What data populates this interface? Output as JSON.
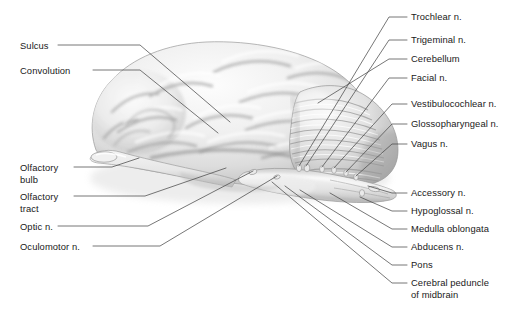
{
  "figure": {
    "background_color": "#ffffff",
    "text_color": "#1a1a1a",
    "leader_line_color": "#4a4a4a"
  },
  "labels_left": [
    {
      "name": "sulcus",
      "text": "Sulcus",
      "text2": "",
      "x": 20,
      "y": 40
    },
    {
      "name": "convolution",
      "text": "Convolution",
      "text2": "",
      "x": 20,
      "y": 65
    },
    {
      "name": "olfactory-bulb",
      "text": "Olfactory",
      "text2": "bulb",
      "x": 20,
      "y": 162
    },
    {
      "name": "olfactory-tract",
      "text": "Olfactory",
      "text2": "tract",
      "x": 20,
      "y": 191
    },
    {
      "name": "optic-n",
      "text": "Optic n.",
      "text2": "",
      "x": 20,
      "y": 221
    },
    {
      "name": "oculomotor-n",
      "text": "Oculomotor n.",
      "text2": "",
      "x": 20,
      "y": 241
    }
  ],
  "labels_right": [
    {
      "name": "trochlear-n",
      "text": "Trochlear n.",
      "text2": "",
      "x": 411,
      "y": 11
    },
    {
      "name": "trigeminal-n",
      "text": "Trigeminal n.",
      "text2": "",
      "x": 411,
      "y": 34
    },
    {
      "name": "cerebellum",
      "text": "Cerebellum",
      "text2": "",
      "x": 411,
      "y": 53
    },
    {
      "name": "facial-n",
      "text": "Facial n.",
      "text2": "",
      "x": 411,
      "y": 72
    },
    {
      "name": "vestibulocochlear-n",
      "text": "Vestibulocochlear n.",
      "text2": "",
      "x": 411,
      "y": 98
    },
    {
      "name": "glossopharyngeal-n",
      "text": "Glossopharyngeal n.",
      "text2": "",
      "x": 411,
      "y": 118
    },
    {
      "name": "vagus-n",
      "text": "Vagus n.",
      "text2": "",
      "x": 411,
      "y": 138
    },
    {
      "name": "accessory-n",
      "text": "Accessory n.",
      "text2": "",
      "x": 411,
      "y": 187
    },
    {
      "name": "hypoglossal-n",
      "text": "Hypoglossal n.",
      "text2": "",
      "x": 411,
      "y": 205
    },
    {
      "name": "medulla-oblongata",
      "text": "Medulla oblongata",
      "text2": "",
      "x": 411,
      "y": 223
    },
    {
      "name": "abducens-n",
      "text": "Abducens n.",
      "text2": "",
      "x": 411,
      "y": 241
    },
    {
      "name": "pons",
      "text": "Pons",
      "text2": "",
      "x": 411,
      "y": 259
    },
    {
      "name": "cerebral-peduncle",
      "text": "Cerebral peduncle",
      "text2": "of midbrain",
      "x": 411,
      "y": 277
    }
  ],
  "leader_lines": {
    "sulcus": "M 58 45 L 140 45 L 230 122",
    "convolution": "M 93 70 L 140 70 L 218 133",
    "olfactory_bulb": "M 74 167 L 112 167 L 139 158",
    "olfactory_tract": "M 74 196 L 145 196 L 226 168",
    "optic_n": "M 58 226 L 148 226 L 253 171",
    "oculomotor_n": "M 93 246 L 160 246 L 277 176",
    "trochlear_n": "M 407 17 L 389 17 L 299 166",
    "trigeminal_n": "M 407 40 L 389 40 L 306 166",
    "cerebellum": "M 407 59 L 389 59 L 318 103",
    "facial_n": "M 407 78 L 389 78 L 322 167",
    "vestibulocochlear_n": "M 407 104 L 392 104 L 334 168",
    "glossopharyngeal_n": "M 407 124 L 392 124 L 346 172",
    "vagus_n": "M 407 144 L 392 144 L 356 176",
    "accessory_n": "M 407 193 L 392 193 L 368 186",
    "hypoglossal_n": "M 407 211 L 392 211 L 360 197",
    "medulla_oblongata": "M 407 229 L 392 229 L 330 193",
    "abducens_n": "M 407 247 L 392 247 L 300 190",
    "pons": "M 407 265 L 392 265 L 285 186",
    "cerebral_peduncle": "M 407 283 L 392 283 L 272 182"
  }
}
